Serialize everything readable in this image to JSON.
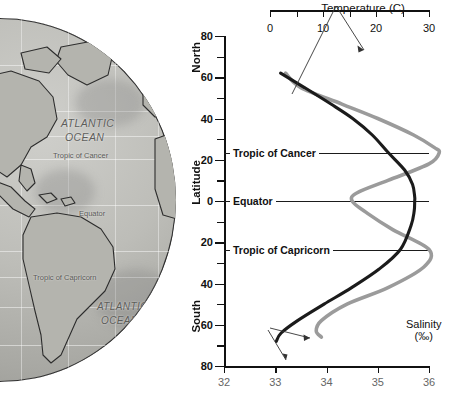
{
  "globe": {
    "ocean_label_north": "ATLANTIC\nOCEAN",
    "ocean_label_north_line1": "ATLANTIC",
    "ocean_label_north_line2": "OCEAN",
    "ocean_label_south_line1": "ATLANTIC",
    "ocean_label_south_line2": "OCEAN",
    "tropic_of_cancer": "Tropic of Cancer",
    "equator": "Equator",
    "tropic_of_capricorn": "Tropic of Capricorn"
  },
  "chart_axes": {
    "latitude_axis_label": "Latitude",
    "north_label": "North",
    "south_label": "South",
    "temperature_title": "Temperature (C)",
    "salinity_title_line1": "Salinity",
    "salinity_title_line2": "(‰)"
  },
  "reference_lines": [
    {
      "name": "tropic-of-cancer",
      "label": "Tropic of Cancer",
      "latitude": 23.5
    },
    {
      "name": "equator",
      "label": "Equator",
      "latitude": 0
    },
    {
      "name": "tropic-of-capricorn",
      "label": "Tropic of Capricorn",
      "latitude": -23.5
    }
  ],
  "chart_data": {
    "type": "line",
    "title": "Temperature (C)",
    "xlabel": "Temperature (C) / Salinity (‰)",
    "ylabel": "Latitude",
    "ylim": [
      -80,
      80
    ],
    "y_ticks_major": [
      80,
      60,
      40,
      20,
      0,
      20,
      40,
      60,
      80
    ],
    "y_ticks_minor_step": 10,
    "grid": false,
    "legend": "annotated",
    "axes": [
      {
        "name": "temperature",
        "position": "top",
        "label": "Temperature (C)",
        "ticks": [
          0,
          5,
          10,
          15,
          20,
          25,
          30
        ],
        "tick_labels": [
          "0",
          "",
          "10",
          "",
          "20",
          "",
          "30"
        ],
        "range": [
          0,
          30
        ],
        "color": "#1b1b1b"
      },
      {
        "name": "salinity",
        "position": "bottom",
        "label": "Salinity (‰)",
        "ticks": [
          32,
          33,
          34,
          35,
          36
        ],
        "tick_labels": [
          "32",
          "33",
          "34",
          "35",
          "36"
        ],
        "range": [
          32,
          36
        ],
        "color": "#6b6b6b"
      }
    ],
    "series": [
      {
        "name": "Temperature",
        "unit": "C",
        "axis": "temperature",
        "color": "#1b1b1b",
        "latitudes": [
          62,
          55,
          47,
          40,
          32,
          23.5,
          15,
          8,
          2,
          0,
          -5,
          -12,
          -23.5,
          -33,
          -42,
          -50,
          -58,
          -64,
          -68
        ],
        "values": [
          2.0,
          6.5,
          11.5,
          15.6,
          19.3,
          22.3,
          25.4,
          26.9,
          27.3,
          27.3,
          27.2,
          26.6,
          24.6,
          20.6,
          15.4,
          10.2,
          5.2,
          2.1,
          1.2
        ]
      },
      {
        "name": "Salinity",
        "unit": "‰",
        "axis": "salinity",
        "color": "#9b9b9b",
        "latitudes": [
          62,
          55,
          47,
          40,
          32,
          26,
          23.5,
          18,
          10,
          4,
          0,
          -6,
          -14,
          -23.5,
          -32,
          -42,
          -50,
          -58,
          -63,
          -66
        ],
        "values": [
          33.2,
          33.5,
          34.3,
          35.0,
          35.7,
          36.1,
          36.2,
          36.0,
          35.2,
          34.6,
          34.5,
          34.8,
          35.3,
          36.0,
          35.9,
          35.2,
          34.4,
          33.9,
          33.8,
          33.9
        ]
      }
    ]
  },
  "annotations": [
    {
      "name": "temperature-pointer",
      "text": "Temperature (C)",
      "points_to": "temperature-curve"
    },
    {
      "name": "salinity-pointer-upper",
      "text": "Salinity (‰)",
      "points_to": "salinity-curve"
    },
    {
      "name": "salinity-pointer-lower",
      "text": "Salinity (‰)",
      "points_to": "salinity-axis"
    }
  ],
  "colors": {
    "temperature_curve": "#1b1b1b",
    "salinity_curve": "#9b9b9b",
    "axis": "#111111",
    "reference_line": "#1b1b1b",
    "ocean_fill": "#b5b5b0",
    "land_fill": "#b6b6b0"
  }
}
